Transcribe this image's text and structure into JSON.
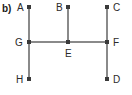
{
  "figure": {
    "part_label": "b)",
    "width": 132,
    "height": 95,
    "background_color": "#ffffff",
    "line_color": "#8a8a8a",
    "dot_color": "#3a3a3a",
    "label_color": "#2a2a2a",
    "part_label_color": "#1a1a1a"
  },
  "points": [
    {
      "name": "A",
      "label": "A",
      "x": 29,
      "y": 7,
      "label_x": 17,
      "label_y": 2,
      "label_side": "left"
    },
    {
      "name": "B",
      "label": "B",
      "x": 68,
      "y": 7,
      "label_x": 56,
      "label_y": 2,
      "label_side": "left"
    },
    {
      "name": "C",
      "label": "C",
      "x": 107,
      "y": 7,
      "label_x": 113,
      "label_y": 2,
      "label_side": "right"
    },
    {
      "name": "G",
      "label": "G",
      "x": 29,
      "y": 42,
      "label_x": 15,
      "label_y": 37,
      "label_side": "left"
    },
    {
      "name": "E",
      "label": "E",
      "x": 68,
      "y": 42,
      "label_x": 65,
      "label_y": 48,
      "label_side": "below"
    },
    {
      "name": "F",
      "label": "F",
      "x": 107,
      "y": 42,
      "label_x": 113,
      "label_y": 37,
      "label_side": "right"
    },
    {
      "name": "H",
      "label": "H",
      "x": 29,
      "y": 79,
      "label_x": 16,
      "label_y": 74,
      "label_side": "left"
    },
    {
      "name": "D",
      "label": "D",
      "x": 107,
      "y": 79,
      "label_x": 113,
      "label_y": 74,
      "label_side": "right"
    }
  ],
  "segments": [
    {
      "name": "segment-A-H",
      "from": "A",
      "to": "H",
      "x1": 29,
      "y1": 7,
      "x2": 29,
      "y2": 79,
      "orientation": "vertical"
    },
    {
      "name": "segment-B-E",
      "from": "B",
      "to": "E",
      "x1": 68,
      "y1": 7,
      "x2": 68,
      "y2": 42,
      "orientation": "vertical"
    },
    {
      "name": "segment-C-D",
      "from": "C",
      "to": "D",
      "x1": 107,
      "y1": 7,
      "x2": 107,
      "y2": 79,
      "orientation": "vertical"
    },
    {
      "name": "segment-G-F",
      "from": "G",
      "to": "F",
      "x1": 29,
      "y1": 42,
      "x2": 107,
      "y2": 42,
      "orientation": "horizontal"
    }
  ]
}
